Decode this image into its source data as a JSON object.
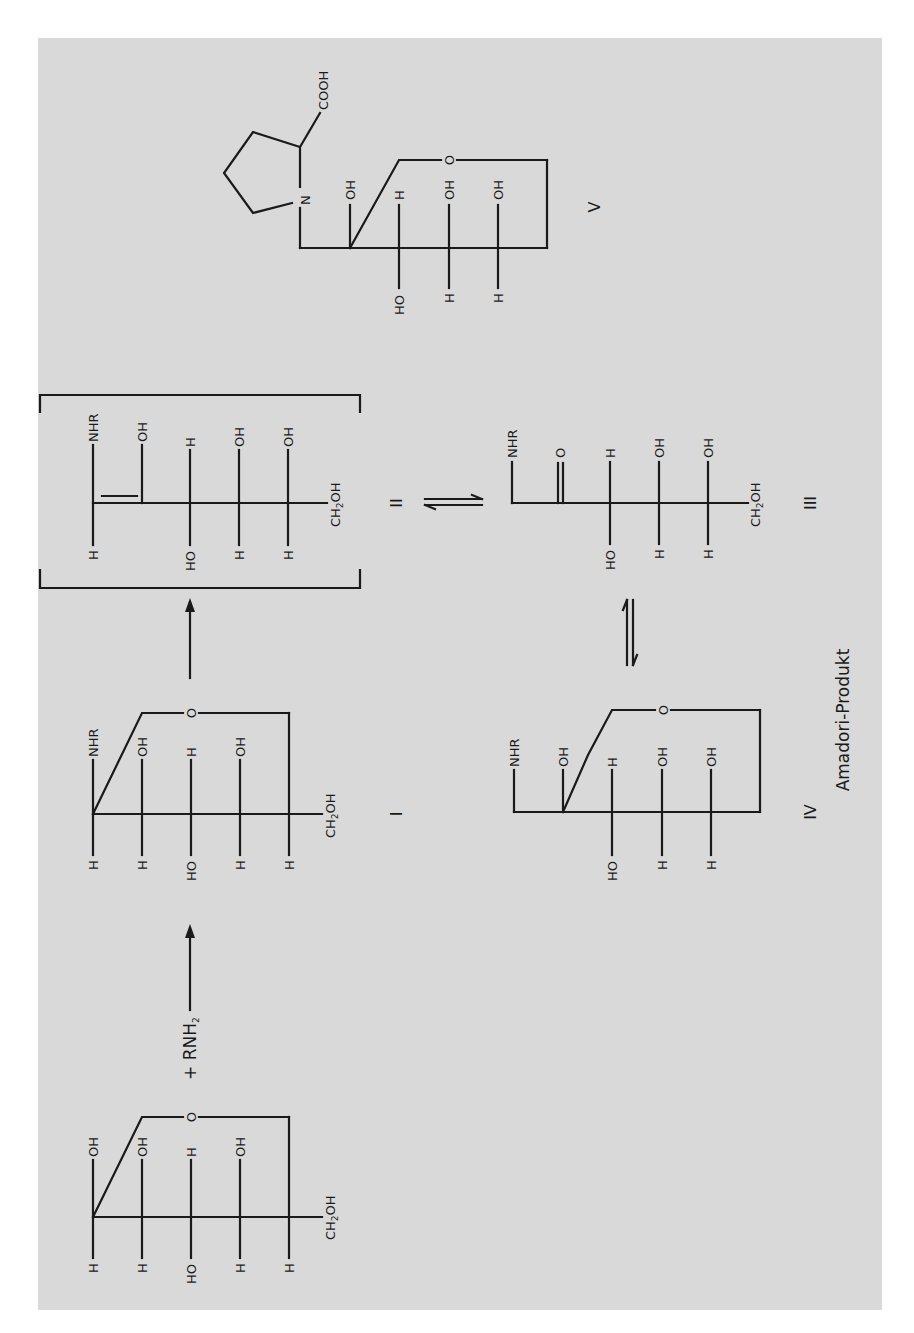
{
  "figure": {
    "colors": {
      "panel": "#d9d9d9",
      "ink": "#1a1a1a",
      "page": "#ffffff"
    },
    "reagent": {
      "prefix": "+ RNH",
      "sub": "2"
    },
    "caption": "Amadori-Produkt",
    "ch2oh": {
      "a": "CH",
      "sub": "2",
      "b": "OH"
    },
    "atoms": {
      "O": "O",
      "N": "N",
      "OH": "OH",
      "HO": "HO",
      "H": "H",
      "NHR": "NHR",
      "COOH": "COOH"
    },
    "structures": [
      {
        "id": "glucose",
        "label": "",
        "top": [
          "OH",
          "OH",
          "H",
          "OH"
        ],
        "bottom": [
          "H",
          "H",
          "HO",
          "H",
          "H"
        ],
        "form": "pyranose"
      },
      {
        "id": "I",
        "label": "I",
        "top": [
          "NHR",
          "OH",
          "H",
          "OH"
        ],
        "bottom": [
          "H",
          "H",
          "HO",
          "H",
          "H"
        ],
        "form": "glycosylamine"
      },
      {
        "id": "II",
        "label": "II",
        "top": [
          "NHR",
          "OH",
          "H",
          "OH",
          "OH"
        ],
        "bottom": [
          "H",
          "",
          "HO",
          "H",
          "H"
        ],
        "form": "enaminol (bracketed)"
      },
      {
        "id": "III",
        "label": "III",
        "top": [
          "NHR",
          "O",
          "H",
          "OH",
          "OH"
        ],
        "bottom": [
          "",
          "",
          "HO",
          "H",
          "H"
        ],
        "form": "open-chain ketose"
      },
      {
        "id": "IV",
        "label": "IV",
        "top": [
          "NHR",
          "OH",
          "H",
          "OH",
          "OH"
        ],
        "bottom": [
          "",
          "",
          "HO",
          "H",
          "H"
        ],
        "form": "cyclic ketose"
      },
      {
        "id": "V",
        "label": "V",
        "top": [
          "N",
          "OH",
          "H",
          "OH",
          "OH"
        ],
        "bottom": [
          "",
          "",
          "HO",
          "H",
          "H"
        ],
        "form": "proline derivative",
        "extra": "COOH"
      }
    ],
    "arrows": [
      {
        "from": "glucose",
        "to": "I",
        "type": "forward"
      },
      {
        "from": "I",
        "to": "II",
        "type": "forward"
      },
      {
        "from": "II",
        "to": "III",
        "type": "equilibrium"
      },
      {
        "from": "III",
        "to": "IV",
        "type": "equilibrium"
      }
    ],
    "labels": {
      "I": "I",
      "II": "II",
      "III": "III",
      "IV": "IV",
      "V": "V"
    }
  }
}
